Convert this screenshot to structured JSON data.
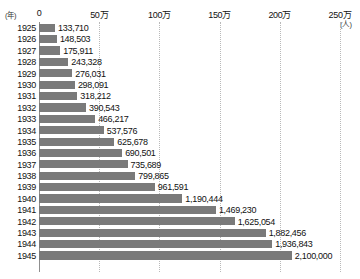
{
  "chart": {
    "type": "bar",
    "orientation": "horizontal",
    "year_axis_label": "(年)",
    "unit_label": "(人)",
    "bar_color": "#7a7a7a",
    "gridline_color": "#b9b9b9",
    "axis_line_color": "#8f8f8f",
    "background_color": "#ffffff",
    "text_color": "#111111"
  },
  "chart_data": {
    "type": "bar",
    "title": "",
    "xlabel": "(人)",
    "ylabel": "(年)",
    "grid": true,
    "legend": "none",
    "xlim": [
      0,
      2500000
    ],
    "xticks": [
      {
        "value": 0,
        "label": "0"
      },
      {
        "value": 500000,
        "label": "50万"
      },
      {
        "value": 1000000,
        "label": "100万"
      },
      {
        "value": 1500000,
        "label": "150万"
      },
      {
        "value": 2000000,
        "label": "200万"
      },
      {
        "value": 2500000,
        "label": "250万"
      }
    ],
    "categories": [
      "1925",
      "1926",
      "1927",
      "1928",
      "1929",
      "1930",
      "1931",
      "1932",
      "1933",
      "1934",
      "1935",
      "1936",
      "1937",
      "1938",
      "1939",
      "1940",
      "1941",
      "1942",
      "1943",
      "1944",
      "1945"
    ],
    "values": [
      133710,
      148503,
      175911,
      243328,
      276031,
      298091,
      318212,
      390543,
      466217,
      537576,
      625678,
      690501,
      735689,
      799865,
      961591,
      1190444,
      1469230,
      1625054,
      1882456,
      1936843,
      2100000
    ],
    "value_labels": [
      "133,710",
      "148,503",
      "175,911",
      "243,328",
      "276,031",
      "298,091",
      "318,212",
      "390,543",
      "466,217",
      "537,576",
      "625,678",
      "690,501",
      "735,689",
      "799,865",
      "961,591",
      "1,190,444",
      "1,469,230",
      "1,625,054",
      "1,882,456",
      "1,936,843",
      "2,100,000"
    ]
  }
}
